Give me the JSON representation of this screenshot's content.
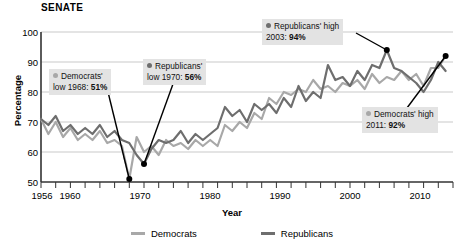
{
  "chart_title": "SENATE",
  "axes": {
    "xlabel": "Year",
    "ylabel": "Percentage",
    "y_ticks": [
      "100",
      "90",
      "80",
      "70",
      "60",
      "50"
    ],
    "x_ticks": [
      "1956",
      "1960",
      "1970",
      "1980",
      "1990",
      "2000",
      "2010"
    ]
  },
  "legend": {
    "items": [
      {
        "label": "Democrats",
        "color": "#a8a8a8"
      },
      {
        "label": "Republicans",
        "color": "#6e6e6e"
      }
    ]
  },
  "callouts": [
    {
      "id": "dem-low",
      "party": "dem",
      "line1": "Democrats'",
      "line2_prefix": "low 1968: ",
      "line2_value": "51%"
    },
    {
      "id": "rep-low",
      "party": "rep",
      "line1": "Republicans'",
      "line2_prefix": "low 1970: ",
      "line2_value": "56%"
    },
    {
      "id": "rep-high",
      "party": "rep",
      "line1": "Republicans' high",
      "line2_prefix": "2003: ",
      "line2_value": "94%"
    },
    {
      "id": "dem-high",
      "party": "dem",
      "line1": "Democrats' high",
      "line2_prefix": "2011: ",
      "line2_value": "92%"
    }
  ],
  "chart_data": {
    "type": "line",
    "title": "SENATE",
    "xlabel": "Year",
    "ylabel": "Percentage",
    "xlim": [
      1956,
      2012
    ],
    "ylim": [
      50,
      100
    ],
    "grid": true,
    "legend_position": "bottom",
    "x": [
      1956,
      1957,
      1958,
      1959,
      1960,
      1961,
      1962,
      1963,
      1964,
      1965,
      1966,
      1967,
      1968,
      1969,
      1970,
      1971,
      1972,
      1973,
      1974,
      1975,
      1976,
      1977,
      1978,
      1979,
      1980,
      1981,
      1982,
      1983,
      1984,
      1985,
      1986,
      1987,
      1988,
      1989,
      1990,
      1991,
      1992,
      1993,
      1994,
      1995,
      1996,
      1997,
      1998,
      1999,
      2000,
      2001,
      2002,
      2003,
      2004,
      2005,
      2006,
      2007,
      2008,
      2009,
      2010,
      2011
    ],
    "series": [
      {
        "name": "Democrats",
        "color": "#a8a8a8",
        "values": [
          71,
          66,
          70,
          65,
          68,
          64,
          66,
          64,
          67,
          63,
          64,
          62,
          51,
          65,
          60,
          62,
          59,
          64,
          62,
          63,
          61,
          64,
          62,
          64,
          62,
          69,
          67,
          70,
          68,
          73,
          71,
          78,
          76,
          80,
          79,
          81,
          80,
          84,
          81,
          82,
          80,
          83,
          82,
          84,
          81,
          86,
          83,
          85,
          84,
          87,
          84,
          86,
          82,
          88,
          88,
          92
        ]
      },
      {
        "name": "Republicans",
        "color": "#6e6e6e",
        "values": [
          71,
          69,
          72,
          67,
          69,
          66,
          68,
          66,
          69,
          65,
          67,
          64,
          63,
          59,
          56,
          61,
          64,
          63,
          64,
          67,
          63,
          66,
          64,
          66,
          68,
          75,
          72,
          74,
          70,
          76,
          74,
          76,
          73,
          78,
          75,
          82,
          77,
          80,
          78,
          89,
          84,
          85,
          82,
          87,
          84,
          89,
          88,
          94,
          88,
          87,
          85,
          83,
          80,
          84,
          90,
          87
        ]
      }
    ],
    "annotations": [
      {
        "label": "Democrats' low 1968",
        "year": 1968,
        "value": 51,
        "series": "Democrats"
      },
      {
        "label": "Republicans' low 1970",
        "year": 1970,
        "value": 56,
        "series": "Republicans"
      },
      {
        "label": "Republicans' high 2003",
        "year": 2003,
        "value": 94,
        "series": "Republicans"
      },
      {
        "label": "Democrats' high 2011",
        "year": 2011,
        "value": 92,
        "series": "Democrats"
      }
    ]
  }
}
